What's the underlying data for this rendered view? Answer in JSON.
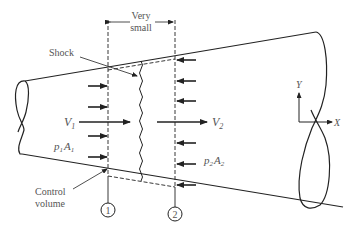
{
  "diagram": {
    "type": "normal-shock-control-volume",
    "colors": {
      "stroke": "#222222",
      "text": "#555555",
      "background": "#ffffff"
    },
    "labels": {
      "very_line1": "Very",
      "very_line2": "small",
      "shock": "Shock",
      "v1": "V",
      "v1_sub": "1",
      "v2": "V",
      "v2_sub": "2",
      "p1": "p",
      "p1_sub": "1",
      "a1": "A",
      "a1_sub": "1",
      "p2": "p",
      "p2_sub": "2",
      "a2": "A",
      "a2_sub": "2",
      "control_line1": "Control",
      "control_line2": "volume",
      "station1": "1",
      "station2": "2",
      "axis_y": "Y",
      "axis_x": "X"
    }
  }
}
